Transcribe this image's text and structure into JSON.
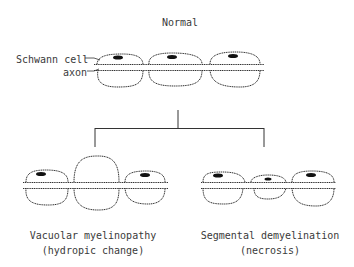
{
  "diagram": {
    "title": "Normal",
    "labels": {
      "schwann_cell": "Schwann cell",
      "axon": "axon"
    },
    "branches": [
      {
        "name": "Vacuolar myelinopathy",
        "subtitle": "(hydropic change)"
      },
      {
        "name": "Segmental demyelination",
        "subtitle": "(necrosis)"
      }
    ],
    "colors": {
      "stroke": "#333333",
      "nucleus": "#111111",
      "background": "#ffffff"
    }
  }
}
